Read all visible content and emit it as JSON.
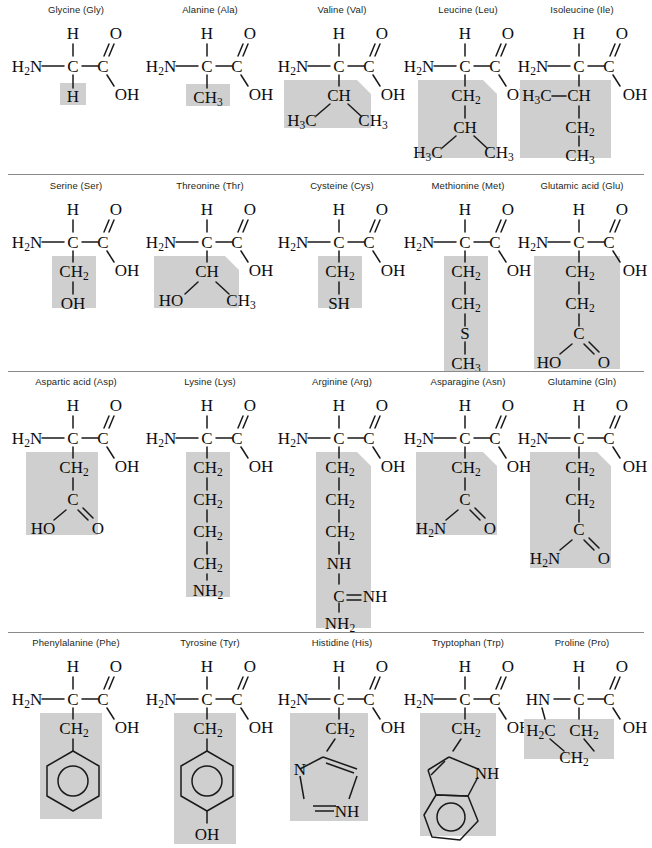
{
  "figure": {
    "type": "diagram",
    "columns": 5,
    "rows": 4,
    "highlight_color": "#cfcfcf",
    "bond_color": "#1a1a1a",
    "background_color": "#ffffff",
    "label_color": "#231f20",
    "common_backbone": {
      "amino_group": "H2N",
      "alpha_hydrogen": "H",
      "alpha_carbon": "C",
      "carbonyl_carbon": "C",
      "carbonyl_oxygen": "O",
      "hydroxyl": "OH"
    }
  },
  "rows": [
    {
      "index": 0,
      "amino_acids": [
        {
          "name": "Glycine (Gly)",
          "full_name": "Glycine",
          "abbrev": "Gly",
          "side_chain_label": "H",
          "side_chain_atoms": [
            "H"
          ]
        },
        {
          "name": "Alanine (Ala)",
          "full_name": "Alanine",
          "abbrev": "Ala",
          "side_chain_label": "CH3",
          "side_chain_atoms": [
            "CH3"
          ]
        },
        {
          "name": "Valine (Val)",
          "full_name": "Valine",
          "abbrev": "Val",
          "side_chain_label": "CH(CH3)2",
          "side_chain_atoms": [
            "CH",
            "H3C",
            "CH3"
          ]
        },
        {
          "name": "Leucine (Leu)",
          "full_name": "Leucine",
          "abbrev": "Leu",
          "side_chain_label": "CH2CH(CH3)2",
          "side_chain_atoms": [
            "CH2",
            "CH",
            "H3C",
            "CH3"
          ]
        },
        {
          "name": "Isoleucine (Ile)",
          "full_name": "Isoleucine",
          "abbrev": "Ile",
          "side_chain_label": "CH(CH3)CH2CH3",
          "side_chain_atoms": [
            "H3C",
            "CH",
            "CH2",
            "CH3"
          ]
        }
      ]
    },
    {
      "index": 1,
      "amino_acids": [
        {
          "name": "Serine (Ser)",
          "full_name": "Serine",
          "abbrev": "Ser",
          "side_chain_label": "CH2OH",
          "side_chain_atoms": [
            "CH2",
            "OH"
          ]
        },
        {
          "name": "Threonine (Thr)",
          "full_name": "Threonine",
          "abbrev": "Thr",
          "side_chain_label": "CH(OH)CH3",
          "side_chain_atoms": [
            "CH",
            "HO",
            "CH3"
          ]
        },
        {
          "name": "Cysteine (Cys)",
          "full_name": "Cysteine",
          "abbrev": "Cys",
          "side_chain_label": "CH2SH",
          "side_chain_atoms": [
            "CH2",
            "SH"
          ]
        },
        {
          "name": "Methionine (Met)",
          "full_name": "Methionine",
          "abbrev": "Met",
          "side_chain_label": "CH2CH2SCH3",
          "side_chain_atoms": [
            "CH2",
            "CH2",
            "S",
            "CH3"
          ]
        },
        {
          "name": "Glutamic acid (Glu)",
          "full_name": "Glutamic acid",
          "abbrev": "Glu",
          "side_chain_label": "CH2CH2COOH",
          "side_chain_atoms": [
            "CH2",
            "CH2",
            "C",
            "HO",
            "O"
          ]
        }
      ]
    },
    {
      "index": 2,
      "amino_acids": [
        {
          "name": "Aspartic acid (Asp)",
          "full_name": "Aspartic acid",
          "abbrev": "Asp",
          "side_chain_label": "CH2COOH",
          "side_chain_atoms": [
            "CH2",
            "C",
            "HO",
            "O"
          ]
        },
        {
          "name": "Lysine (Lys)",
          "full_name": "Lysine",
          "abbrev": "Lys",
          "side_chain_label": "(CH2)4NH2",
          "side_chain_atoms": [
            "CH2",
            "CH2",
            "CH2",
            "CH2",
            "NH2"
          ]
        },
        {
          "name": "Arginine (Arg)",
          "full_name": "Arginine",
          "abbrev": "Arg",
          "side_chain_label": "(CH2)3NHC(=NH)NH2",
          "side_chain_atoms": [
            "CH2",
            "CH2",
            "CH2",
            "NH",
            "C",
            "NH",
            "NH2"
          ]
        },
        {
          "name": "Asparagine (Asn)",
          "full_name": "Asparagine",
          "abbrev": "Asn",
          "side_chain_label": "CH2CONH2",
          "side_chain_atoms": [
            "CH2",
            "C",
            "H2N",
            "O"
          ]
        },
        {
          "name": "Glutamine (Gln)",
          "full_name": "Glutamine",
          "abbrev": "Gln",
          "side_chain_label": "CH2CH2CONH2",
          "side_chain_atoms": [
            "CH2",
            "CH2",
            "C",
            "H2N",
            "O"
          ]
        }
      ]
    },
    {
      "index": 3,
      "amino_acids": [
        {
          "name": "Phenylalanine (Phe)",
          "full_name": "Phenylalanine",
          "abbrev": "Phe",
          "side_chain_label": "CH2-phenyl",
          "side_chain_atoms": [
            "CH2",
            "benzene ring"
          ]
        },
        {
          "name": "Tyrosine (Tyr)",
          "full_name": "Tyrosine",
          "abbrev": "Tyr",
          "side_chain_label": "CH2-phenol",
          "side_chain_atoms": [
            "CH2",
            "benzene ring",
            "OH"
          ]
        },
        {
          "name": "Histidine (His)",
          "full_name": "Histidine",
          "abbrev": "His",
          "side_chain_label": "CH2-imidazole",
          "side_chain_atoms": [
            "CH2",
            "N",
            "NH"
          ]
        },
        {
          "name": "Tryptophan (Trp)",
          "full_name": "Tryptophan",
          "abbrev": "Trp",
          "side_chain_label": "CH2-indole",
          "side_chain_atoms": [
            "CH2",
            "NH",
            "benzene ring"
          ]
        },
        {
          "name": "Proline (Pro)",
          "full_name": "Proline",
          "abbrev": "Pro",
          "side_chain_label": "pyrrolidine ring",
          "side_chain_atoms": [
            "H2C",
            "CH2",
            "CH2"
          ],
          "note": "Secondary amine: HN instead of H2N; side chain loops back to the nitrogen"
        }
      ]
    }
  ],
  "atoms": {
    "h2n": "H₂N",
    "hn": "HN",
    "h": "H",
    "c": "C",
    "o": "O",
    "oh": "OH",
    "ho": "HO",
    "ch3": "CH₃",
    "h3c": "H₃C",
    "ch2": "CH₂",
    "h2c": "H₂C",
    "ch": "CH",
    "sh": "SH",
    "s": "S",
    "nh": "NH",
    "nh2": "NH₂",
    "n": "N"
  }
}
